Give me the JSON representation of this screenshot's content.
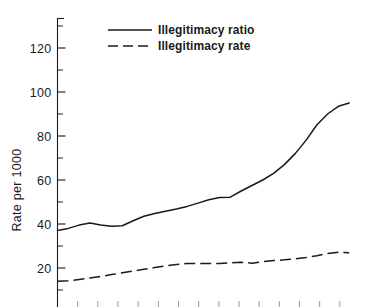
{
  "chart_data": {
    "type": "line",
    "title": "",
    "subtitle": "",
    "xlabel": "",
    "ylabel": "Rate per 1000",
    "ylim": [
      0,
      140
    ],
    "xlim": [
      0,
      14
    ],
    "grid": false,
    "legend_position": "top-left-inside",
    "y_ticks_major": [
      20,
      40,
      60,
      80,
      100,
      120
    ],
    "y_tick_labels": [
      "20",
      "40",
      "60",
      "80",
      "100",
      "120"
    ],
    "y_ticks_minor": [
      10,
      30,
      50,
      70,
      90,
      110,
      130
    ],
    "x_tick_count": 14,
    "x_tick_labels": [],
    "annotations": [],
    "series": [
      {
        "name": "Illegitimacy ratio",
        "style": "solid",
        "color": "#1a1a1a",
        "x": [
          0,
          0.5,
          1,
          1.5,
          2,
          2.5,
          3,
          3.5,
          4,
          4.5,
          5,
          5.5,
          6,
          6.5,
          7,
          7.5,
          8,
          8.5,
          9,
          9.5,
          10,
          10.5,
          11,
          11.5,
          12,
          12.5,
          13,
          13.5
        ],
        "values": [
          37,
          38,
          39.5,
          40.5,
          39.5,
          39,
          39.2,
          41.5,
          43.5,
          44.8,
          45.8,
          46.8,
          48,
          49.5,
          51,
          52,
          52.2,
          55,
          57.5,
          60,
          63,
          67,
          72,
          78,
          85,
          90,
          93.5,
          95
        ]
      },
      {
        "name": "Illegitimacy rate",
        "style": "dashed",
        "color": "#1a1a1a",
        "x": [
          0,
          0.5,
          1,
          1.5,
          2,
          2.5,
          3,
          3.5,
          4,
          4.5,
          5,
          5.5,
          6,
          6.5,
          7,
          7.5,
          8,
          8.5,
          9,
          9.5,
          10,
          10.5,
          11,
          11.5,
          12,
          12.5,
          13,
          13.5
        ],
        "values": [
          14,
          14.2,
          14.8,
          15.5,
          16.2,
          17,
          17.8,
          18.6,
          19.4,
          20.2,
          21,
          21.6,
          22,
          22.1,
          22,
          22.1,
          22.4,
          22.6,
          22.2,
          22.9,
          23.4,
          23.7,
          24.2,
          24.8,
          25.6,
          26.6,
          27.2,
          26.9
        ]
      }
    ]
  },
  "legend": {
    "entries": [
      {
        "label": "Illegitimacy ratio",
        "style": "solid"
      },
      {
        "label": "Illegitimacy rate",
        "style": "dashed"
      }
    ]
  },
  "axis": {
    "y_title": "Rate per 1000"
  }
}
